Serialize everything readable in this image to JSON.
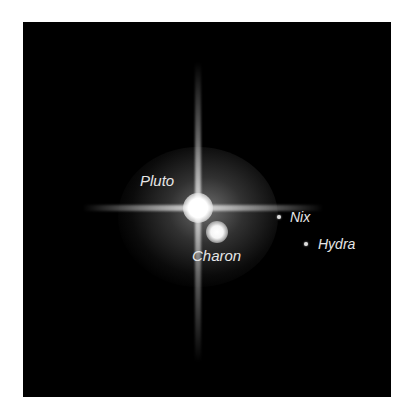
{
  "image": {
    "subject": "Pluto system telescope image",
    "background_color": "#000000",
    "frame_color": "#ffffff"
  },
  "labels": {
    "pluto": "Pluto",
    "charon": "Charon",
    "nix": "Nix",
    "hydra": "Hydra"
  },
  "colors": {
    "label_text": "#e6e6e6",
    "body_glow": "#ffffff"
  }
}
